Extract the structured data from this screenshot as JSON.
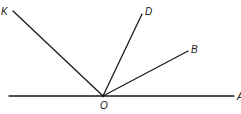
{
  "diagram": {
    "type": "geometry-angles",
    "vertex": {
      "label": "O",
      "x": 103,
      "y": 96
    },
    "rays": [
      {
        "id": "K",
        "label": "K",
        "x2": 13,
        "y2": 11,
        "label_x": 2,
        "label_y": 15
      },
      {
        "id": "D",
        "label": "D",
        "x2": 142,
        "y2": 14,
        "label_x": 145,
        "label_y": 15
      },
      {
        "id": "B",
        "label": "B",
        "x2": 188,
        "y2": 51,
        "label_x": 191,
        "label_y": 53
      },
      {
        "id": "A",
        "label": "A",
        "x2": 234,
        "y2": 96,
        "label_x": 237,
        "label_y": 100
      }
    ],
    "baseline": {
      "x1": 9,
      "y1": 96,
      "x2": 234,
      "y2": 96
    },
    "labels": {
      "K": "K",
      "D": "D",
      "B": "B",
      "O": "O",
      "A": "A"
    }
  }
}
